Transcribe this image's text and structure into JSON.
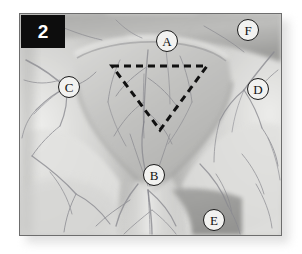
{
  "figure": {
    "number_badge": "2",
    "type": "grayscale-anatomical-photograph",
    "frame": {
      "border_color": "#6d6d6d",
      "background_color": "#d9d9d9",
      "shadow_color": "#c8c8c8"
    },
    "badge": {
      "background_color": "#0d0d0d",
      "text_color": "#ffffff"
    }
  },
  "overlay": {
    "dashed_triangle": {
      "label": "dashed-triangle-outline",
      "stroke_color": "#111111",
      "stroke_width": 3,
      "dash_pattern": "7,5",
      "orientation": "apex-down",
      "points": "92,52 187,52 140,116"
    }
  },
  "markers": [
    {
      "id": "A",
      "label": "A",
      "x": 136,
      "y": 16,
      "name": "marker-a"
    },
    {
      "id": "B",
      "label": "B",
      "x": 123,
      "y": 150,
      "name": "marker-b"
    },
    {
      "id": "C",
      "label": "C",
      "x": 38,
      "y": 62,
      "name": "marker-c"
    },
    {
      "id": "D",
      "label": "D",
      "x": 227,
      "y": 64,
      "name": "marker-d"
    },
    {
      "id": "E",
      "label": "E",
      "x": 183,
      "y": 195,
      "name": "marker-e"
    },
    {
      "id": "F",
      "label": "F",
      "x": 217,
      "y": 5,
      "name": "marker-f"
    }
  ],
  "palette": {
    "tissue_light": "#e6e6e4",
    "tissue_mid": "#cfcfcd",
    "tissue_dark": "#a8a8a6",
    "tissue_shadow": "#8e8e8c",
    "vein_color": "#8a8a90",
    "vein_dark": "#6f6f76"
  }
}
